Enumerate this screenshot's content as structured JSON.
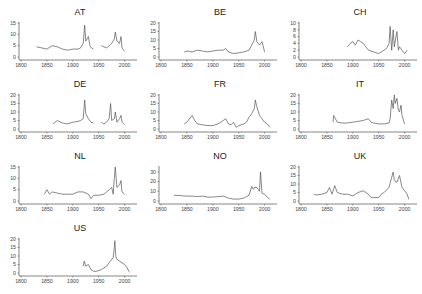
{
  "chart_data": [
    {
      "type": "line",
      "title": "AT",
      "xlabel": "",
      "ylabel": "",
      "xlim": [
        1800,
        2020
      ],
      "ylim": [
        0,
        15
      ],
      "yticks": [
        0,
        5,
        10,
        15
      ],
      "xticks": [
        1800,
        1850,
        1900,
        1950,
        2000
      ],
      "x": [
        1830,
        1840,
        1850,
        1860,
        1870,
        1880,
        1890,
        1900,
        1910,
        1915,
        1920,
        1923,
        1925,
        1930,
        1933,
        1936,
        1940,
        1950,
        1955,
        1960,
        1965,
        1970,
        1975,
        1980,
        1982,
        1985,
        1990,
        1993,
        1995,
        2000
      ],
      "values": [
        4.5,
        4,
        3.5,
        5,
        4.5,
        3.5,
        3,
        3.5,
        3.5,
        4,
        6,
        14,
        7,
        9,
        5,
        4,
        3.5,
        null,
        5,
        4.5,
        4,
        5,
        6,
        8,
        11,
        7,
        6,
        9,
        4,
        2.5
      ]
    },
    {
      "type": "line",
      "title": "BE",
      "xlim": [
        1800,
        2020
      ],
      "ylim": [
        0,
        20
      ],
      "yticks": [
        0,
        5,
        10,
        15,
        20
      ],
      "xticks": [
        1800,
        1850,
        1900,
        1950,
        2000
      ],
      "x": [
        1845,
        1850,
        1860,
        1870,
        1880,
        1890,
        1900,
        1910,
        1920,
        1925,
        1930,
        1940,
        1950,
        1960,
        1970,
        1975,
        1980,
        1982,
        1985,
        1990,
        1995,
        2000
      ],
      "values": [
        3,
        3.5,
        3,
        4,
        3.5,
        3,
        3.5,
        4,
        4,
        5,
        3,
        2,
        2.5,
        3,
        4,
        7,
        10,
        15,
        9,
        7,
        9,
        3
      ]
    },
    {
      "type": "line",
      "title": "CH",
      "xlim": [
        1800,
        2020
      ],
      "ylim": [
        0,
        10
      ],
      "yticks": [
        0,
        2,
        4,
        6,
        8,
        10
      ],
      "xticks": [
        1800,
        1850,
        1900,
        1950,
        2000
      ],
      "x": [
        1890,
        1895,
        1900,
        1905,
        1910,
        1915,
        1920,
        1925,
        1930,
        1940,
        1950,
        1955,
        1960,
        1965,
        1970,
        1972,
        1975,
        1978,
        1980,
        1985,
        1988,
        1990,
        1995,
        2000,
        2005
      ],
      "values": [
        3,
        4,
        4.5,
        3.5,
        5,
        4.5,
        4,
        3,
        2,
        1.5,
        1,
        1.5,
        2,
        2.5,
        4,
        9,
        2,
        8,
        3,
        7.5,
        2,
        3,
        2,
        1,
        2
      ]
    },
    {
      "type": "line",
      "title": "DE",
      "xlim": [
        1800,
        2020
      ],
      "ylim": [
        0,
        20
      ],
      "yticks": [
        0,
        5,
        10,
        15,
        20
      ],
      "xticks": [
        1800,
        1850,
        1900,
        1950,
        2000
      ],
      "x": [
        1862,
        1870,
        1880,
        1890,
        1900,
        1910,
        1915,
        1920,
        1923,
        1925,
        1930,
        1935,
        1940,
        1950,
        1955,
        1960,
        1965,
        1970,
        1973,
        1975,
        1980,
        1982,
        1985,
        1990,
        1993,
        1995,
        2000
      ],
      "values": [
        3,
        5,
        3.5,
        3,
        4,
        4.5,
        5,
        6,
        17,
        9,
        6,
        4,
        3.5,
        null,
        4,
        3,
        4,
        6,
        15,
        5,
        6,
        10,
        4,
        6,
        8,
        4,
        2.5
      ]
    },
    {
      "type": "line",
      "title": "FR",
      "xlim": [
        1800,
        2020
      ],
      "ylim": [
        0,
        20
      ],
      "yticks": [
        0,
        5,
        10,
        15,
        20
      ],
      "xticks": [
        1800,
        1850,
        1900,
        1950,
        2000
      ],
      "x": [
        1845,
        1850,
        1855,
        1860,
        1865,
        1870,
        1880,
        1890,
        1900,
        1910,
        1920,
        1925,
        1930,
        1935,
        1940,
        1945,
        1950,
        1960,
        1965,
        1970,
        1975,
        1980,
        1982,
        1985,
        1990,
        1995,
        2000,
        2005,
        2010
      ],
      "values": [
        3,
        4,
        6,
        8,
        5,
        3,
        2.5,
        2,
        2,
        3,
        5,
        6,
        3,
        2.5,
        4,
        1,
        2,
        3,
        4,
        7,
        9,
        12,
        17,
        13,
        8,
        6,
        4,
        3,
        1
      ]
    },
    {
      "type": "line",
      "title": "IT",
      "xlim": [
        1800,
        2020
      ],
      "ylim": [
        0,
        20
      ],
      "yticks": [
        0,
        5,
        10,
        15,
        20
      ],
      "xticks": [
        1800,
        1850,
        1900,
        1950,
        2000
      ],
      "x": [
        1862,
        1863,
        1870,
        1880,
        1890,
        1900,
        1910,
        1920,
        1930,
        1935,
        1940,
        1950,
        1960,
        1970,
        1972,
        1975,
        1978,
        1980,
        1982,
        1985,
        1988,
        1990,
        1993,
        1995,
        2000
      ],
      "values": [
        4,
        8,
        4,
        3.5,
        3.5,
        4,
        4.5,
        5,
        6,
        4,
        3.5,
        3,
        3,
        3.5,
        6,
        17,
        12,
        20,
        15,
        18,
        11,
        10,
        14,
        8,
        3
      ]
    },
    {
      "type": "line",
      "title": "NL",
      "xlim": [
        1800,
        2020
      ],
      "ylim": [
        0,
        15
      ],
      "yticks": [
        0,
        5,
        10,
        15
      ],
      "xticks": [
        1800,
        1850,
        1900,
        1950,
        2000
      ],
      "x": [
        1845,
        1850,
        1855,
        1860,
        1870,
        1880,
        1890,
        1900,
        1910,
        1920,
        1930,
        1935,
        1940,
        1950,
        1960,
        1965,
        1970,
        1975,
        1978,
        1980,
        1982,
        1985,
        1990,
        1993,
        1995,
        2000
      ],
      "values": [
        3,
        5,
        3,
        4,
        3.5,
        3,
        3,
        3,
        4,
        4,
        3,
        1,
        2.5,
        2.5,
        3,
        4,
        5,
        6,
        3,
        10,
        15,
        6,
        7,
        9,
        4,
        3
      ]
    },
    {
      "type": "line",
      "title": "NO",
      "xlim": [
        1800,
        2020
      ],
      "ylim": [
        0,
        35
      ],
      "yticks": [
        0,
        10,
        20,
        30
      ],
      "xticks": [
        1800,
        1850,
        1900,
        1950,
        2000
      ],
      "x": [
        1825,
        1840,
        1850,
        1860,
        1870,
        1880,
        1890,
        1900,
        1910,
        1920,
        1930,
        1940,
        1950,
        1960,
        1970,
        1975,
        1978,
        1980,
        1985,
        1990,
        1992,
        1995,
        2000,
        2005,
        2010
      ],
      "values": [
        6,
        5.5,
        5,
        5,
        4.5,
        5,
        4,
        4,
        4.5,
        5,
        3,
        2,
        2,
        3,
        6,
        15,
        12,
        14,
        14,
        10,
        30,
        8,
        7,
        4,
        2
      ]
    },
    {
      "type": "line",
      "title": "UK",
      "xlim": [
        1800,
        2020
      ],
      "ylim": [
        0,
        20
      ],
      "yticks": [
        0,
        5,
        10,
        15,
        20
      ],
      "xticks": [
        1800,
        1850,
        1900,
        1950,
        2000
      ],
      "x": [
        1825,
        1830,
        1840,
        1850,
        1855,
        1860,
        1865,
        1870,
        1880,
        1890,
        1900,
        1910,
        1920,
        1930,
        1935,
        1940,
        1950,
        1955,
        1960,
        1970,
        1975,
        1978,
        1980,
        1985,
        1990,
        1995,
        2000,
        2005,
        2008
      ],
      "values": [
        4,
        3.5,
        4,
        5,
        8,
        4,
        9,
        5,
        4,
        4,
        3,
        5,
        6,
        4,
        2,
        2,
        2,
        4,
        5,
        8,
        14,
        17,
        12,
        11,
        15,
        8,
        6,
        4,
        1
      ]
    },
    {
      "type": "line",
      "title": "US",
      "xlim": [
        1800,
        2020
      ],
      "ylim": [
        0,
        20
      ],
      "yticks": [
        0,
        5,
        10,
        15,
        20
      ],
      "xticks": [
        1800,
        1850,
        1900,
        1950,
        2000
      ],
      "x": [
        1920,
        1922,
        1925,
        1930,
        1935,
        1940,
        1945,
        1950,
        1955,
        1960,
        1965,
        1970,
        1975,
        1978,
        1980,
        1981,
        1983,
        1985,
        1990,
        1995,
        2000,
        2005,
        2008,
        2010
      ],
      "values": [
        4,
        7,
        4,
        5,
        2,
        1,
        1,
        1.5,
        2,
        3,
        4,
        6,
        8,
        9,
        15,
        19,
        10,
        8,
        7,
        6,
        5,
        3,
        1,
        0.5
      ]
    }
  ],
  "panels": [
    {
      "title": "AT"
    },
    {
      "title": "BE"
    },
    {
      "title": "CH"
    },
    {
      "title": "DE"
    },
    {
      "title": "FR"
    },
    {
      "title": "IT"
    },
    {
      "title": "NL"
    },
    {
      "title": "NO"
    },
    {
      "title": "UK"
    },
    {
      "title": "US"
    }
  ],
  "colors": {
    "line": "#555555",
    "axis": "#333333"
  }
}
